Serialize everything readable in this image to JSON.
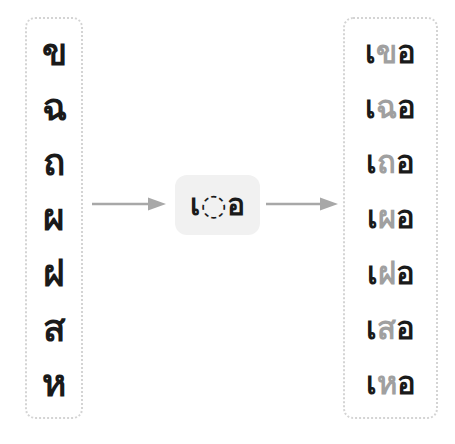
{
  "diagram": {
    "colors": {
      "background": "#ffffff",
      "column_border": "#d4d4d4",
      "chip_background": "#f1f1f1",
      "text_dark": "#1a1a1a",
      "text_gray": "#a0a0a0",
      "arrow": "#a8a8a8"
    }
  },
  "source_column": {
    "name": "source-consonants",
    "items": [
      {
        "char": "ข"
      },
      {
        "char": "ฉ"
      },
      {
        "char": "ถ"
      },
      {
        "char": "ผ"
      },
      {
        "char": "ฝ"
      },
      {
        "char": "ส"
      },
      {
        "char": "ห"
      }
    ]
  },
  "pattern": {
    "name": "vowel-pattern",
    "leading_vowel": "เ",
    "placeholder": "◌",
    "trailing_vowel": "อ",
    "full": "เ◌อ"
  },
  "result_column": {
    "name": "result-syllables",
    "items": [
      {
        "prefix": "เ",
        "consonant": "ข",
        "suffix": "อ",
        "full": "เขอ"
      },
      {
        "prefix": "เ",
        "consonant": "ฉ",
        "suffix": "อ",
        "full": "เฉอ"
      },
      {
        "prefix": "เ",
        "consonant": "ถ",
        "suffix": "อ",
        "full": "เถอ"
      },
      {
        "prefix": "เ",
        "consonant": "ผ",
        "suffix": "อ",
        "full": "เผอ"
      },
      {
        "prefix": "เ",
        "consonant": "ฝ",
        "suffix": "อ",
        "full": "เฝอ"
      },
      {
        "prefix": "เ",
        "consonant": "ส",
        "suffix": "อ",
        "full": "เสอ"
      },
      {
        "prefix": "เ",
        "consonant": "ห",
        "suffix": "อ",
        "full": "เหอ"
      }
    ]
  },
  "arrows": [
    {
      "name": "arrow-source-to-pattern",
      "direction": "right"
    },
    {
      "name": "arrow-pattern-to-result",
      "direction": "right"
    }
  ]
}
